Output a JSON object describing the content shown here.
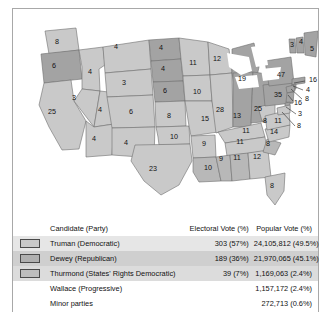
{
  "figure": {
    "border_color": "#a8a8a8",
    "background": "#ffffff"
  },
  "map": {
    "name": "united-states-electoral-map-1948",
    "colors": {
      "truman": "#c9c9c9",
      "dewey": "#a3a3a3",
      "thurmond": "#b8b8b8",
      "water": "#ffffff",
      "border": "#6e6e6e"
    },
    "states": [
      {
        "code": "WA",
        "value": "8",
        "winner": "truman",
        "x": 44,
        "y": 33
      },
      {
        "code": "OR",
        "value": "6",
        "winner": "dewey",
        "x": 41,
        "y": 57
      },
      {
        "code": "CA",
        "value": "25",
        "winner": "truman",
        "x": 39,
        "y": 103
      },
      {
        "code": "ID",
        "value": "4",
        "winner": "truman",
        "x": 77,
        "y": 63
      },
      {
        "code": "NV",
        "value": "3",
        "winner": "truman",
        "x": 61,
        "y": 89
      },
      {
        "code": "UT",
        "value": "4",
        "winner": "truman",
        "x": 87,
        "y": 101
      },
      {
        "code": "AZ",
        "value": "4",
        "winner": "truman",
        "x": 81,
        "y": 130
      },
      {
        "code": "MT",
        "value": "4",
        "winner": "truman",
        "x": 103,
        "y": 38
      },
      {
        "code": "WY",
        "value": "3",
        "winner": "truman",
        "x": 111,
        "y": 74
      },
      {
        "code": "CO",
        "value": "6",
        "winner": "truman",
        "x": 118,
        "y": 103
      },
      {
        "code": "NM",
        "value": "4",
        "winner": "truman",
        "x": 113,
        "y": 134
      },
      {
        "code": "ND",
        "value": "4",
        "winner": "dewey",
        "x": 148,
        "y": 39
      },
      {
        "code": "SD",
        "value": "4",
        "winner": "dewey",
        "x": 150,
        "y": 60
      },
      {
        "code": "NE",
        "value": "6",
        "winner": "dewey",
        "x": 152,
        "y": 82
      },
      {
        "code": "KS",
        "value": "8",
        "winner": "truman",
        "x": 156,
        "y": 107
      },
      {
        "code": "OK",
        "value": "10",
        "winner": "truman",
        "x": 161,
        "y": 128
      },
      {
        "code": "TX",
        "value": "23",
        "winner": "truman",
        "x": 140,
        "y": 160
      },
      {
        "code": "MN",
        "value": "11",
        "winner": "truman",
        "x": 180,
        "y": 54
      },
      {
        "code": "IA",
        "value": "10",
        "winner": "truman",
        "x": 184,
        "y": 83
      },
      {
        "code": "MO",
        "value": "15",
        "winner": "truman",
        "x": 192,
        "y": 110
      },
      {
        "code": "AR",
        "value": "9",
        "winner": "truman",
        "x": 191,
        "y": 135
      },
      {
        "code": "LA",
        "value": "10",
        "winner": "thurmond",
        "x": 195,
        "y": 159
      },
      {
        "code": "WI",
        "value": "12",
        "winner": "truman",
        "x": 204,
        "y": 50
      },
      {
        "code": "IL",
        "value": "28",
        "winner": "truman",
        "x": 207,
        "y": 101
      },
      {
        "code": "MI",
        "value": "19",
        "winner": "dewey",
        "x": 229,
        "y": 70
      },
      {
        "code": "IN",
        "value": "13",
        "winner": "dewey",
        "x": 224,
        "y": 107
      },
      {
        "code": "OH",
        "value": "25",
        "winner": "dewey",
        "x": 245,
        "y": 100
      },
      {
        "code": "KY",
        "value": "11",
        "winner": "truman",
        "x": 233,
        "y": 122
      },
      {
        "code": "TN",
        "value": "11",
        "winner": "truman",
        "x": 227,
        "y": 133
      },
      {
        "code": "MS",
        "value": "9",
        "winner": "thurmond",
        "x": 208,
        "y": 150
      },
      {
        "code": "AL",
        "value": "11",
        "winner": "thurmond",
        "x": 224,
        "y": 149
      },
      {
        "code": "GA",
        "value": "12",
        "winner": "truman",
        "x": 244,
        "y": 148
      },
      {
        "code": "FL",
        "value": "8",
        "winner": "truman",
        "x": 259,
        "y": 177
      },
      {
        "code": "SC",
        "value": "8",
        "winner": "thurmond",
        "x": 255,
        "y": 135
      },
      {
        "code": "NC",
        "value": "14",
        "winner": "truman",
        "x": 261,
        "y": 123
      },
      {
        "code": "WV",
        "value": "8",
        "winner": "truman",
        "x": 252,
        "y": 112
      },
      {
        "code": "VA",
        "value": "11",
        "winner": "truman",
        "x": 265,
        "y": 112
      },
      {
        "code": "PA",
        "value": "35",
        "winner": "dewey",
        "x": 265,
        "y": 86
      },
      {
        "code": "NY",
        "value": "47",
        "winner": "dewey",
        "x": 268,
        "y": 66
      },
      {
        "code": "VT",
        "value": "3",
        "winner": "dewey",
        "x": 279,
        "y": 36
      },
      {
        "code": "NH",
        "value": "4",
        "winner": "dewey",
        "x": 288,
        "y": 33
      },
      {
        "code": "ME",
        "value": "5",
        "winner": "dewey",
        "x": 299,
        "y": 40
      }
    ],
    "callouts": [
      {
        "code": "MA",
        "value": "16",
        "winner": "dewey",
        "label_x": 296,
        "label_y": 71,
        "line": "M 292 72 L 281 74"
      },
      {
        "code": "RI",
        "value": "4",
        "winner": "dewey",
        "label_x": 293,
        "label_y": 81,
        "line": "M 290 81 L 280 77"
      },
      {
        "code": "CT",
        "value": "8",
        "winner": "dewey",
        "label_x": 292,
        "label_y": 90,
        "line": "M 289 90 L 278 80"
      },
      {
        "code": "NJ",
        "value": "16",
        "winner": "dewey",
        "label_x": 281,
        "label_y": 94,
        "line": "M 280 92 L 275 86"
      },
      {
        "code": "DE",
        "value": "3",
        "winner": "dewey",
        "label_x": 285,
        "label_y": 105,
        "line": "M 283 105 L 273 98"
      },
      {
        "code": "MD",
        "value": "8",
        "winner": "truman",
        "label_x": 284,
        "label_y": 117,
        "line": "M 282 117 L 269 103"
      }
    ]
  },
  "table": {
    "name": "election-results-table",
    "headers": {
      "candidate": "Candidate (Party)",
      "electoral": "Electoral Vote (%)",
      "popular": "Popular Vote (%)"
    },
    "rows": [
      {
        "key": "truman",
        "swatch_class": "k-truman",
        "has_swatch": true,
        "shade": "shade-a",
        "candidate": "Truman (Democratic)",
        "electoral": "303 (57%)",
        "popular": "24,105,812 (49.5%)"
      },
      {
        "key": "dewey",
        "swatch_class": "k-dewey",
        "has_swatch": true,
        "shade": "shade-b",
        "candidate": "Dewey (Republican)",
        "electoral": "189 (36%)",
        "popular": "21,970,065 (45.1%)"
      },
      {
        "key": "thurmond",
        "swatch_class": "k-thurmond",
        "has_swatch": true,
        "shade": "shade-c",
        "candidate": "Thurmond (States' Rights Democratic)",
        "electoral": "39 (7%)",
        "popular": "1,169,063 (2.4%)"
      },
      {
        "key": "wallace",
        "swatch_class": "",
        "has_swatch": false,
        "shade": "shade-none",
        "candidate": "Wallace (Progressive)",
        "electoral": "",
        "popular": "1,157,172 (2.4%)"
      },
      {
        "key": "minor",
        "swatch_class": "",
        "has_swatch": false,
        "shade": "shade-none",
        "candidate": "Minor parties",
        "electoral": "",
        "popular": "272,713 (0.6%)"
      }
    ]
  }
}
